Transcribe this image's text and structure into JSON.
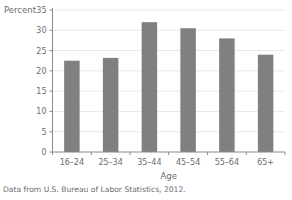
{
  "chart_data": {
    "type": "bar",
    "title": "",
    "subtitle": "",
    "categories": [
      "16–24",
      "25–34",
      "35–44",
      "45–54",
      "55–64",
      "65+"
    ],
    "values": [
      22.5,
      23.2,
      32.0,
      30.5,
      28.0,
      24.0
    ],
    "xlabel": "Age",
    "ylabel": "Percent",
    "ylim": [
      0,
      35
    ],
    "yticks": [
      0,
      5,
      10,
      15,
      20,
      25,
      30,
      35
    ],
    "ytick_labels": [
      "0",
      "5",
      "10",
      "15",
      "20",
      "25",
      "30",
      "35"
    ],
    "grid": "horizontal",
    "legend": "none",
    "bar_color": "#808080",
    "gridline_color": "#e2e2e2",
    "axis_color": "#8a8a8a",
    "text_color": "#6b6b6b",
    "background_color": "#ffffff",
    "caption": "Data from U.S. Bureau of Labor Statistics, 2012."
  }
}
